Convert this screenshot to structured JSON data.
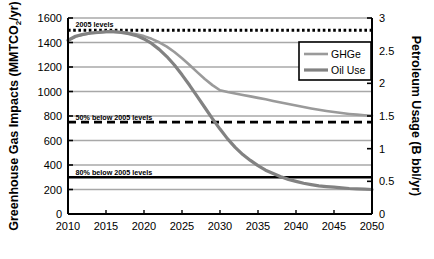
{
  "chart_data": {
    "type": "line",
    "title": "",
    "xlabel": "",
    "ylabel": "Greenhouse Gas Impacts (MMTCO2/yr)",
    "ylabel_left_main": "Greenhouse Gas Impacts (MMTCO",
    "ylabel_left_sub": "2",
    "ylabel_left_tail": "/yr)",
    "ylabel_right": "Petroleum Usage (B bbl/yr)",
    "xlim": [
      2010,
      2050
    ],
    "ylim": [
      0,
      1600
    ],
    "ylim_right": [
      0,
      3
    ],
    "grid": true,
    "legend_position": "upper-right-inside",
    "x": [
      2010,
      2015,
      2020,
      2025,
      2030,
      2035,
      2040,
      2045,
      2050
    ],
    "xticklabels": [
      "2010",
      "2015",
      "2020",
      "2025",
      "2030",
      "2035",
      "2040",
      "2045",
      "2050"
    ],
    "yticks": [
      0,
      200,
      400,
      600,
      800,
      1000,
      1200,
      1400,
      1600
    ],
    "yticklabels": [
      "0",
      "200",
      "400",
      "600",
      "800",
      "1000",
      "1200",
      "1400",
      "1600"
    ],
    "yticks_right": [
      0,
      0.5,
      1,
      1.5,
      2,
      2.5,
      3
    ],
    "yticklabels_right": [
      "0",
      "0.5",
      "1",
      "1.5",
      "2",
      "2.5",
      "3"
    ],
    "series": [
      {
        "name": "GHGe",
        "color": "#9a9a9a",
        "axis": "left",
        "x": [
          2010,
          2011,
          2012,
          2013,
          2014,
          2015,
          2016,
          2017,
          2018,
          2019,
          2020,
          2021,
          2022,
          2023,
          2024,
          2025,
          2026,
          2027,
          2028,
          2029,
          2030,
          2031,
          2032,
          2033,
          2034,
          2035,
          2036,
          2037,
          2038,
          2039,
          2040,
          2041,
          2042,
          2043,
          2044,
          2045,
          2046,
          2047,
          2048,
          2049,
          2050
        ],
        "values": [
          1415,
          1448,
          1465,
          1475,
          1482,
          1486,
          1487,
          1484,
          1478,
          1467,
          1452,
          1430,
          1402,
          1366,
          1322,
          1272,
          1216,
          1158,
          1102,
          1052,
          1010,
          996,
          984,
          972,
          960,
          948,
          936,
          923,
          910,
          898,
          886,
          874,
          862,
          851,
          841,
          832,
          824,
          817,
          811,
          806,
          802
        ]
      },
      {
        "name": "Oil Use",
        "color": "#828282",
        "axis": "right",
        "x": [
          2010,
          2011,
          2012,
          2013,
          2014,
          2015,
          2016,
          2017,
          2018,
          2019,
          2020,
          2021,
          2022,
          2023,
          2024,
          2025,
          2026,
          2027,
          2028,
          2029,
          2030,
          2031,
          2032,
          2033,
          2034,
          2035,
          2036,
          2037,
          2038,
          2039,
          2040,
          2041,
          2042,
          2043,
          2044,
          2045,
          2046,
          2047,
          2048,
          2049,
          2050
        ],
        "values": [
          2.66,
          2.72,
          2.75,
          2.77,
          2.78,
          2.79,
          2.79,
          2.78,
          2.76,
          2.73,
          2.68,
          2.61,
          2.52,
          2.41,
          2.28,
          2.13,
          1.97,
          1.8,
          1.63,
          1.46,
          1.3,
          1.15,
          1.02,
          0.91,
          0.82,
          0.74,
          0.67,
          0.62,
          0.57,
          0.53,
          0.5,
          0.47,
          0.45,
          0.43,
          0.42,
          0.41,
          0.4,
          0.39,
          0.385,
          0.38,
          0.375
        ]
      }
    ],
    "reference_lines": [
      {
        "name": "2005 levels",
        "label": "2005 levels",
        "value": 1500,
        "style": "dotted",
        "color": "#000000",
        "label_x": 2011,
        "label_y": 1560
      },
      {
        "name": "50% below 2005 levels",
        "label": "50% below 2005 levels",
        "value": 750,
        "style": "dashed",
        "color": "#000000",
        "label_x": 2011,
        "label_y": 800
      },
      {
        "name": "80% below 2005 levels",
        "label": "80% below 2005 levels",
        "value": 300,
        "style": "solid",
        "color": "#000000",
        "label_x": 2011,
        "label_y": 350
      }
    ],
    "legend": [
      {
        "label": "GHGe",
        "color": "#9a9a9a"
      },
      {
        "label": "Oil Use",
        "color": "#828282"
      }
    ]
  },
  "axes": {
    "left_title_main": "Greenhouse Gas Impacts (MMTCO",
    "left_title_sub": "2",
    "left_title_tail": "/yr)",
    "right_title": "Petroleum Usage (B bbl/yr)"
  },
  "ticks": {
    "y_left": [
      "1600",
      "1400",
      "1200",
      "1000",
      "800",
      "600",
      "400",
      "200",
      "0"
    ],
    "y_right": [
      "3",
      "2.5",
      "2",
      "1.5",
      "1",
      "0.5",
      "0"
    ],
    "x": [
      "2010",
      "2015",
      "2020",
      "2025",
      "2030",
      "2035",
      "2040",
      "2045",
      "2050"
    ]
  },
  "annotations": {
    "line_2005": "2005 levels",
    "line_50": "50% below 2005 levels",
    "line_80": "80% below 2005 levels"
  },
  "legend": {
    "ghge": "GHGe",
    "oil_use": "Oil Use"
  },
  "colors": {
    "ghge": "#9a9a9a",
    "oil_use": "#828282",
    "grid": "#a8a8a8",
    "axis": "#000000"
  }
}
